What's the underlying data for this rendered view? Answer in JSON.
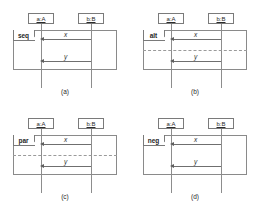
{
  "figure": {
    "background": "#ffffff",
    "line_color": "#8a8a8a",
    "text_color": "#2b2b2b"
  },
  "lifelines": {
    "left": {
      "label": "a:A"
    },
    "right": {
      "label": "b:B"
    }
  },
  "messages": {
    "first": {
      "label": "x",
      "direction": "right-to-left"
    },
    "second": {
      "label": "y",
      "direction": "right-to-left"
    }
  },
  "panels": [
    {
      "id": "panel-a",
      "operator": "seq",
      "caption": "(a)",
      "has_operand_divider": false,
      "left_lifeline": "a:A",
      "right_lifeline": "b:B",
      "messages": [
        "x",
        "y"
      ]
    },
    {
      "id": "panel-b",
      "operator": "alt",
      "caption": "(b)",
      "has_operand_divider": true,
      "left_lifeline": "a:A",
      "right_lifeline": "b:B",
      "messages": [
        "x",
        "y"
      ]
    },
    {
      "id": "panel-c",
      "operator": "par",
      "caption": "(c)",
      "has_operand_divider": true,
      "left_lifeline": "a:A",
      "right_lifeline": "b:B",
      "messages": [
        "x",
        "y"
      ]
    },
    {
      "id": "panel-d",
      "operator": "neg",
      "caption": "(d)",
      "has_operand_divider": false,
      "left_lifeline": "a:A",
      "right_lifeline": "b:B",
      "messages": [
        "x",
        "y"
      ]
    }
  ]
}
